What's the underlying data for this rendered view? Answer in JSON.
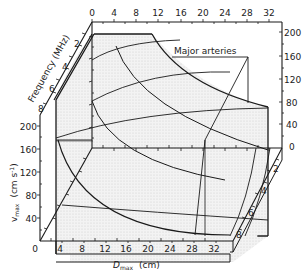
{
  "figure": {
    "type": "3d-surface-diagram",
    "annotation": "Major arteries",
    "axes": {
      "frequency": {
        "title": "Frequency (MHz)",
        "ticks_left": [
          "2",
          "4",
          "6",
          "8"
        ],
        "ticks_right": [
          "0",
          "2",
          "4",
          "6",
          "8"
        ]
      },
      "vmax": {
        "title_main": "v",
        "title_sub": "max",
        "title_units": "(cm s",
        "title_exp": "-1",
        "title_close": ")",
        "ticks_left": [
          "40",
          "80",
          "120",
          "160",
          "200"
        ],
        "ticks_right": [
          "0",
          "40",
          "80",
          "120",
          "160",
          "200"
        ],
        "bottom_zero": "0"
      },
      "dmax": {
        "title_main": "D",
        "title_sub": "max",
        "title_units": "(cm)",
        "ticks_bottom": [
          "4",
          "8",
          "12",
          "16",
          "20",
          "24",
          "28",
          "32"
        ],
        "ticks_top": [
          "0",
          "4",
          "8",
          "12",
          "16",
          "20",
          "24",
          "28",
          "32"
        ]
      }
    },
    "colors": {
      "line": "#1a1a1a",
      "surface_shade": "#ececec",
      "background": "#ffffff"
    }
  }
}
